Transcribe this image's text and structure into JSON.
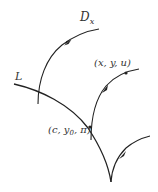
{
  "diagram": {
    "labels": {
      "Dx": {
        "main": "D",
        "sub": "x"
      },
      "L": "L",
      "point_xyu": "(x, y, u)",
      "point_c": {
        "pre": "(c, y",
        "sub": "0",
        "post": ", π)"
      }
    },
    "colors": {
      "stroke": "#222222",
      "text": "#333333",
      "background": "#ffffff"
    },
    "elements": [
      {
        "name": "curve-L",
        "type": "curve",
        "label": "L"
      },
      {
        "name": "curve-Dx",
        "type": "directed-curve",
        "label": "D_x"
      },
      {
        "name": "characteristic-through-xyu",
        "type": "directed-curve",
        "marked_point": "(x, y, u)"
      },
      {
        "name": "characteristic-lower-right",
        "type": "directed-curve"
      }
    ]
  }
}
